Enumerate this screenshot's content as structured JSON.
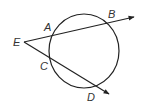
{
  "diagram": {
    "labels": {
      "E": "E",
      "A": "A",
      "B": "B",
      "C": "C",
      "D": "D"
    },
    "colors": {
      "stroke": "#222222",
      "text": "#333333"
    }
  }
}
